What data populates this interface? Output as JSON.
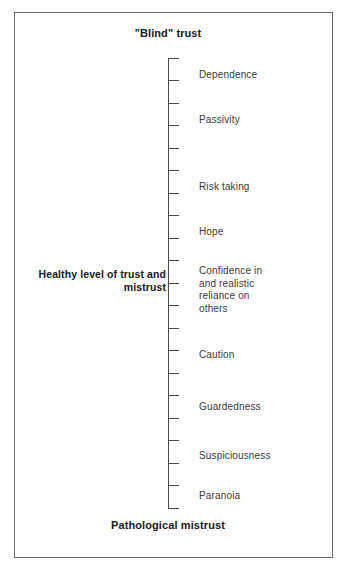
{
  "figure": {
    "title_top": "\"Blind\"\ntrust",
    "title_bottom": "Pathological\nmistrust",
    "midpoint_label": "Healthy level of\ntrust and mistrust"
  },
  "chart_data": {
    "type": "scatter",
    "orientation": "vertical",
    "axis": {
      "top_anchor": "\"Blind\" trust",
      "bottom_anchor": "Pathological mistrust",
      "midpoint": "Healthy level of trust and mistrust",
      "tick_count": 21,
      "grid": false,
      "legend": "none"
    },
    "categories": [
      "Dependence",
      "Passivity",
      "Risk taking",
      "Hope",
      "Confidence in and realistic reliance on others",
      "Caution",
      "Guardedness",
      "Suspiciousness",
      "Paranoia"
    ],
    "values": [
      0.92,
      0.82,
      0.66,
      0.57,
      0.46,
      0.34,
      0.23,
      0.12,
      0.03
    ],
    "xlabel": "",
    "ylabel": "Trust – mistrust continuum",
    "ylim": [
      0,
      1
    ]
  },
  "ticks": [
    {
      "y": 58
    },
    {
      "y": 80
    },
    {
      "y": 103
    },
    {
      "y": 125
    },
    {
      "y": 148
    },
    {
      "y": 170
    },
    {
      "y": 193
    },
    {
      "y": 215
    },
    {
      "y": 238
    },
    {
      "y": 260
    },
    {
      "y": 283
    },
    {
      "y": 305
    },
    {
      "y": 328
    },
    {
      "y": 350
    },
    {
      "y": 373
    },
    {
      "y": 395
    },
    {
      "y": 418
    },
    {
      "y": 440
    },
    {
      "y": 463
    },
    {
      "y": 485
    },
    {
      "y": 508
    }
  ],
  "descriptors": [
    {
      "label": "Dependence",
      "top": 69
    },
    {
      "label": "Passivity",
      "top": 114
    },
    {
      "label": "Risk taking",
      "top": 181
    },
    {
      "label": "Hope",
      "top": 226
    },
    {
      "label": "Confidence in\nand realistic\nreliance on\nothers",
      "top": 265
    },
    {
      "label": "Caution",
      "top": 349
    },
    {
      "label": "Guardedness",
      "top": 401
    },
    {
      "label": "Suspiciousness",
      "top": 450
    },
    {
      "label": "Paranoia",
      "top": 490
    }
  ]
}
